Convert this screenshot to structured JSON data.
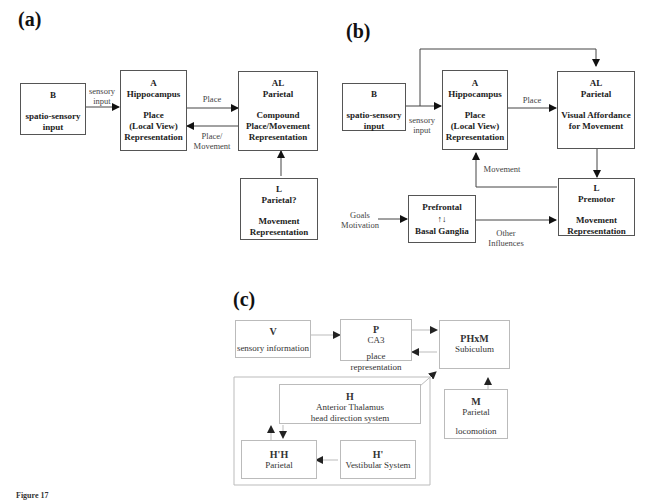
{
  "panels": {
    "a": {
      "label": "(a)",
      "boxes": {
        "B": {
          "id": "B",
          "lines": [
            "spatio-sensory",
            "input"
          ]
        },
        "A": {
          "id": "A",
          "title": "Hippocampus",
          "lines": [
            "Place",
            "(Local View)",
            "Representation"
          ]
        },
        "AL": {
          "id": "AL",
          "title": "Parietal",
          "lines": [
            "Compound",
            "Place/Movement",
            "Representation"
          ]
        },
        "L": {
          "id": "L",
          "title": "Parietal?",
          "lines": [
            "Movement",
            "Representation"
          ]
        }
      },
      "edges": {
        "sensory_input": "sensory input",
        "place": "Place",
        "place_movement": "Place/ Movement"
      }
    },
    "b": {
      "label": "(b)",
      "boxes": {
        "B": {
          "id": "B",
          "lines": [
            "spatio-sensory",
            "input"
          ]
        },
        "A": {
          "id": "A",
          "title": "Hippocampus",
          "lines": [
            "Place",
            "(Local View)",
            "Representation"
          ]
        },
        "AL": {
          "id": "AL",
          "title": "Parietal",
          "lines": [
            "Visual Affordance",
            "for Movement"
          ]
        },
        "L": {
          "id": "L",
          "title": "Premotor",
          "lines": [
            "Movement",
            "Representation"
          ]
        },
        "PF": {
          "top": "Prefrontal",
          "mid": "↑↓",
          "bottom": "Basal Ganglia"
        }
      },
      "edges": {
        "sensory_input": "sensory input",
        "place": "Place",
        "movement": "Movement",
        "goals": "Goals Motivation",
        "other": "Other Influences"
      }
    },
    "c": {
      "label": "(c)",
      "boxes": {
        "V": {
          "id": "V",
          "line": "sensory information"
        },
        "P": {
          "id": "P",
          "line1": "CA3",
          "line2": "place representation"
        },
        "PHxM": {
          "id": "PHxM",
          "line": "Subiculum"
        },
        "H": {
          "id": "H",
          "line1": "Anterior Thalamus",
          "line2": "head direction system"
        },
        "M": {
          "id": "M",
          "line1": "Parietal",
          "line2": "locomotion"
        },
        "HH": {
          "id": "H'H",
          "line": "Parietal"
        },
        "Hp": {
          "id": "H'",
          "line": "Vestibular System"
        }
      }
    }
  },
  "caption": "Figure 17"
}
